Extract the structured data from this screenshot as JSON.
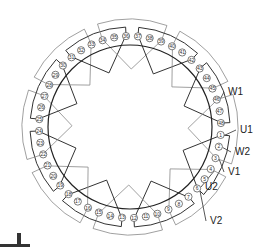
{
  "diagram": {
    "title": "",
    "type": "stator-winding-diagram",
    "slot_count": 48,
    "slot_labels": [
      "1",
      "2",
      "3",
      "4",
      "5",
      "6",
      "7",
      "8",
      "9",
      "10",
      "11",
      "12",
      "13",
      "14",
      "15",
      "16",
      "17",
      "18",
      "19",
      "20",
      "21",
      "22",
      "23",
      "24",
      "25",
      "26",
      "27",
      "28",
      "29",
      "30",
      "31",
      "32",
      "33",
      "34",
      "35",
      "36",
      "37",
      "38",
      "39",
      "40",
      "41",
      "42",
      "43",
      "44",
      "45",
      "46",
      "47",
      "48"
    ],
    "terminals": [
      {
        "label": "W1",
        "slot": 46,
        "x": 228,
        "y": 95
      },
      {
        "label": "U1",
        "slot": 1,
        "x": 240,
        "y": 133
      },
      {
        "label": "W2",
        "slot": 2,
        "x": 235,
        "y": 155
      },
      {
        "label": "V1",
        "slot": 3,
        "x": 228,
        "y": 175
      },
      {
        "label": "U2",
        "slot": 4,
        "x": 205,
        "y": 190
      },
      {
        "label": "V2",
        "slot": 6,
        "x": 210,
        "y": 224
      }
    ],
    "colors": {
      "inner_circle": "#222222",
      "dark_coil": "#333333",
      "light_coil": "#888888",
      "slot_circle": "#444444"
    }
  }
}
